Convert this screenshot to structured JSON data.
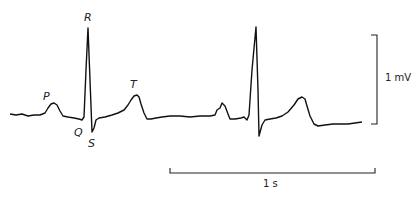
{
  "figure": {
    "wave_labels": {
      "P": "P",
      "Q": "Q",
      "R": "R",
      "S": "S",
      "T": "T"
    },
    "voltage_scale": {
      "label": "1 mV"
    },
    "time_scale": {
      "label": "1 s"
    },
    "colors": {
      "trace": "#111111",
      "background": "#ffffff"
    }
  }
}
